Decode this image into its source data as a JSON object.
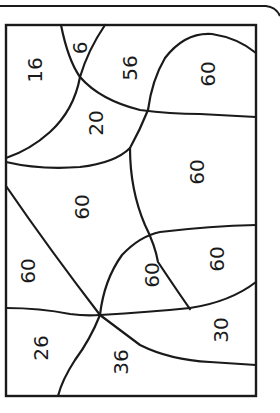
{
  "puzzle": {
    "colors": {
      "line": "#1a1a1a",
      "background": "#ffffff"
    },
    "regions": [
      {
        "id": "r1",
        "label": "16",
        "x": 35,
        "y": 70
      },
      {
        "id": "r2",
        "label": "6",
        "x": 80,
        "y": 48
      },
      {
        "id": "r3",
        "label": "56",
        "x": 130,
        "y": 68
      },
      {
        "id": "r4",
        "label": "60",
        "x": 208,
        "y": 74
      },
      {
        "id": "r5",
        "label": "20",
        "x": 96,
        "y": 123
      },
      {
        "id": "r6",
        "label": "60",
        "x": 197,
        "y": 172
      },
      {
        "id": "r7",
        "label": "60",
        "x": 82,
        "y": 207
      },
      {
        "id": "r8",
        "label": "60",
        "x": 28,
        "y": 271
      },
      {
        "id": "r9",
        "label": "60",
        "x": 152,
        "y": 275
      },
      {
        "id": "r10",
        "label": "60",
        "x": 217,
        "y": 259
      },
      {
        "id": "r11",
        "label": "26",
        "x": 41,
        "y": 348
      },
      {
        "id": "r12",
        "label": "36",
        "x": 121,
        "y": 362
      },
      {
        "id": "r13",
        "label": "30",
        "x": 221,
        "y": 330
      }
    ]
  }
}
